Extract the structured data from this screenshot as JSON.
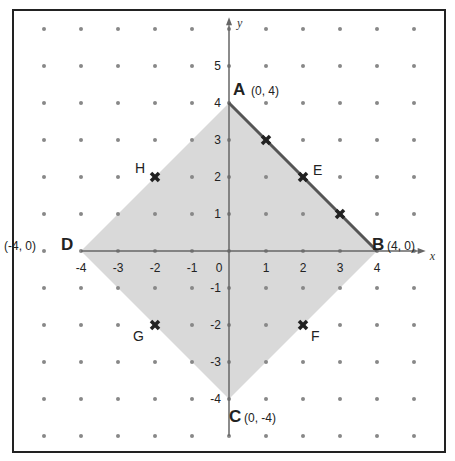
{
  "diagram": {
    "axes": {
      "x_label": "x",
      "y_label": "y",
      "x_ticks": [
        "-4",
        "-3",
        "-2",
        "-1",
        "0",
        "1",
        "2",
        "3",
        "4"
      ],
      "y_ticks_pos": [
        "1",
        "2",
        "3",
        "4",
        "5"
      ],
      "y_ticks_neg": [
        "-1",
        "-2",
        "-3",
        "-4"
      ]
    },
    "grid": {
      "x_min": -5,
      "x_max": 5,
      "y_min": -5,
      "y_max": 6,
      "unit_px": 37
    },
    "colors": {
      "fill": "#d9d9d9",
      "edge": "#555555",
      "axis": "#666666",
      "dot": "#888888",
      "mark": "#222222"
    },
    "vertices": [
      {
        "name": "A",
        "coord": "(0, 4)",
        "x": 0,
        "y": 4
      },
      {
        "name": "B",
        "coord": "(4, 0)",
        "x": 4,
        "y": 0
      },
      {
        "name": "C",
        "coord": "(0, -4)",
        "x": 0,
        "y": -4
      },
      {
        "name": "D",
        "coord": "(-4, 0)",
        "x": -4,
        "y": 0
      }
    ],
    "points": [
      {
        "name": "E",
        "x": 2,
        "y": 2
      },
      {
        "name": "F",
        "x": 2,
        "y": -2
      },
      {
        "name": "G",
        "x": -2,
        "y": -2
      },
      {
        "name": "H",
        "x": -2,
        "y": 2
      },
      {
        "name": "",
        "x": 1,
        "y": 3
      },
      {
        "name": "",
        "x": 3,
        "y": 1
      }
    ]
  }
}
